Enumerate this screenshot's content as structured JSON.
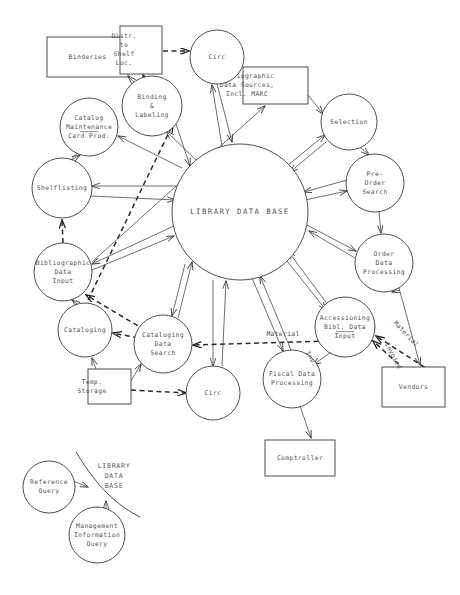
{
  "diagram": {
    "central_node": {
      "id": "library-data-base",
      "label": "LIBRARY DATA BASE",
      "shape": "circle",
      "cx": 240,
      "cy": 212,
      "r": 68
    },
    "process_nodes": [
      {
        "id": "circ-top",
        "label_lines": [
          "Circ"
        ],
        "shape": "circle",
        "cx": 217,
        "cy": 57,
        "r": 27
      },
      {
        "id": "binding-labeling",
        "label_lines": [
          "Binding",
          "&",
          "Labeling"
        ],
        "shape": "circle",
        "cx": 152,
        "cy": 106,
        "r": 30
      },
      {
        "id": "catalog-maintenance",
        "label_lines": [
          "Catalog",
          "Maintenance",
          "Card Prod."
        ],
        "shape": "circle",
        "cx": 89,
        "cy": 127,
        "r": 29,
        "rule_after_line": 2
      },
      {
        "id": "shelflisting",
        "label_lines": [
          "Shelflisting"
        ],
        "shape": "circle",
        "cx": 62,
        "cy": 188,
        "r": 30
      },
      {
        "id": "bibliographic-data-input",
        "label_lines": [
          "Bibliographic",
          "Data",
          "Input"
        ],
        "shape": "circle",
        "cx": 63,
        "cy": 272,
        "r": 29
      },
      {
        "id": "cataloging",
        "label_lines": [
          "Cataloging"
        ],
        "shape": "circle",
        "cx": 85,
        "cy": 330,
        "r": 27
      },
      {
        "id": "cataloging-data-search",
        "label_lines": [
          "Cataloging",
          "Data",
          "Search"
        ],
        "shape": "circle",
        "cx": 163,
        "cy": 344,
        "r": 29
      },
      {
        "id": "circ-bottom",
        "label_lines": [
          "Circ"
        ],
        "shape": "circle",
        "cx": 213,
        "cy": 393,
        "r": 27
      },
      {
        "id": "fiscal-data-processing",
        "label_lines": [
          "Fiscal Data",
          "Processing"
        ],
        "shape": "circle",
        "cx": 292,
        "cy": 379,
        "r": 29
      },
      {
        "id": "accessioning-bibl-data-input",
        "label_lines": [
          "Accessioning",
          "Bibl. Data",
          "Input"
        ],
        "shape": "circle",
        "cx": 345,
        "cy": 327,
        "r": 30,
        "rule_after_line": 2
      },
      {
        "id": "order-data-processing",
        "label_lines": [
          "Order",
          "Data",
          "Processing"
        ],
        "shape": "circle",
        "cx": 384,
        "cy": 263,
        "r": 29
      },
      {
        "id": "pre-order-search",
        "label_lines": [
          "Pre-",
          "Order",
          "Search"
        ],
        "shape": "circle",
        "cx": 375,
        "cy": 183,
        "r": 29
      },
      {
        "id": "selection",
        "label_lines": [
          "Selection"
        ],
        "shape": "circle",
        "cx": 349,
        "cy": 122,
        "r": 28
      }
    ],
    "external_nodes": [
      {
        "id": "binderies",
        "label_lines": [
          "Binderies"
        ],
        "shape": "rect",
        "x": 47,
        "y": 37,
        "w": 81,
        "h": 40,
        "align": "center"
      },
      {
        "id": "distr-to-shelf-loc",
        "label_lines": [
          "Distr.",
          "to",
          "Shelf",
          "Loc."
        ],
        "shape": "rect",
        "x": 120,
        "y": 26,
        "w": 42,
        "h": 48,
        "align": "left"
      },
      {
        "id": "bibliographic-data-sources",
        "label_lines": [
          "Bibliographic",
          "Data Sources,",
          "Incl. MARC"
        ],
        "shape": "rect",
        "x": 243,
        "y": 67,
        "w": 65,
        "h": 37,
        "align": "left"
      },
      {
        "id": "temp-storage",
        "label_lines": [
          "Temp.",
          "Storage"
        ],
        "shape": "rect",
        "x": 88,
        "y": 369,
        "w": 43,
        "h": 35,
        "align": "left"
      },
      {
        "id": "vendors",
        "label_lines": [
          "Vendors"
        ],
        "shape": "rect",
        "x": 382,
        "y": 367,
        "w": 63,
        "h": 40,
        "align": "center"
      },
      {
        "id": "comptroller",
        "label_lines": [
          "Comptroller"
        ],
        "shape": "rect",
        "x": 265,
        "y": 440,
        "w": 70,
        "h": 36,
        "align": "center"
      }
    ],
    "edge_labels": [
      {
        "id": "material-left",
        "text": "Material",
        "x": 283,
        "y": 334,
        "rotate": 0
      },
      {
        "id": "material-right",
        "text": "Material",
        "x": 406,
        "y": 334,
        "rotate": 46
      },
      {
        "id": "invoice-right",
        "text": "Invoice",
        "x": 393,
        "y": 356,
        "rotate": 62
      },
      {
        "id": "inv-left",
        "text": "Inv.",
        "x": 311,
        "y": 359,
        "rotate": 62
      }
    ],
    "legend": {
      "id": "query-legend",
      "database_label_lines": [
        "LIBRARY",
        "DATA",
        "BASE"
      ],
      "database_label_x": 114,
      "database_label_y": 467,
      "nodes": [
        {
          "id": "reference-query",
          "label_lines": [
            "Reference",
            "Query"
          ],
          "shape": "circle",
          "cx": 49,
          "cy": 487,
          "r": 26
        },
        {
          "id": "management-information-query",
          "label_lines": [
            "Management",
            "Information",
            "Query"
          ],
          "shape": "circle",
          "cx": 97,
          "cy": 535,
          "r": 28
        }
      ]
    },
    "colors": {
      "background": "#ffffff",
      "stroke": "#3b3b3b",
      "edge": "#4a4a4a",
      "dashed_edge": "#2b2b2b",
      "text": "#555555"
    }
  }
}
